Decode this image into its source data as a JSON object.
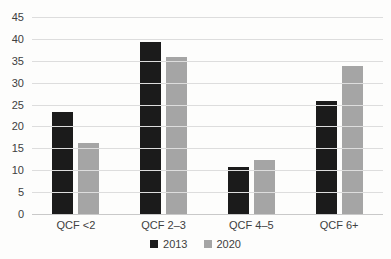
{
  "chart_data": {
    "type": "bar",
    "title": "",
    "xlabel": "",
    "ylabel": "",
    "categories": [
      "QCF <2",
      "QCF 2–3",
      "QCF 4–5",
      "QCF 6+"
    ],
    "series": [
      {
        "name": "2013",
        "color": "#1b1b1b",
        "values": [
          23.5,
          39.5,
          11,
          26
        ]
      },
      {
        "name": "2020",
        "color": "#a5a5a5",
        "values": [
          16.5,
          36,
          12.5,
          34
        ]
      }
    ],
    "ylim": [
      0,
      45
    ],
    "yticks": [
      0,
      5,
      10,
      15,
      20,
      25,
      30,
      35,
      40,
      45
    ],
    "grid": true,
    "legend_position": "bottom"
  },
  "colors": {
    "background": "#fdfdfc",
    "gridline": "#dddddd",
    "baseline": "#c9c9c9",
    "axis_text": "#404040"
  }
}
